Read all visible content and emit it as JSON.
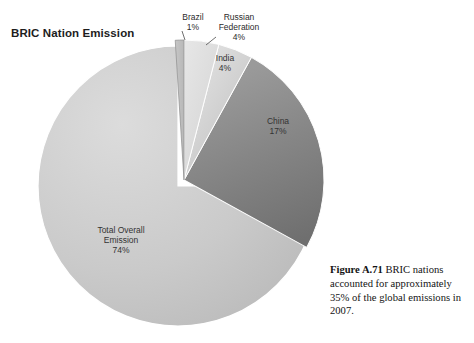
{
  "chart": {
    "title": "BRIC Nation Emission"
  },
  "caption": {
    "figure_number": "Figure A.71",
    "text": " BRIC nations accounted for approximately 35% of the global emissions in 2007."
  },
  "labels": {
    "brazil": "Brazil\n1%",
    "russia": "Russian\nFederation\n4%",
    "india": "India\n4%",
    "china": "China\n17%",
    "total": "Total Overall\nEmission\n74%"
  },
  "chart_data": {
    "type": "pie",
    "title": "BRIC Nation Emission",
    "categories": [
      "Total Overall Emission",
      "China",
      "India",
      "Russian Federation",
      "Brazil"
    ],
    "values": [
      74,
      17,
      4,
      4,
      1
    ],
    "value_unit": "%",
    "data_labels": [
      "74%",
      "17%",
      "4%",
      "4%",
      "1%"
    ],
    "colors": [
      "#c9c9c9",
      "#848484",
      "#d2d2d2",
      "#dedede",
      "#b9b9b9"
    ],
    "exploded_slices": [
      "Total Overall Emission"
    ],
    "start_angle_deg": -90,
    "direction": "clockwise",
    "legend": "none",
    "grid": false,
    "annotations": [
      "Figure A.71  BRIC nations accounted for approximately 35% of the global emissions in 2007."
    ]
  }
}
